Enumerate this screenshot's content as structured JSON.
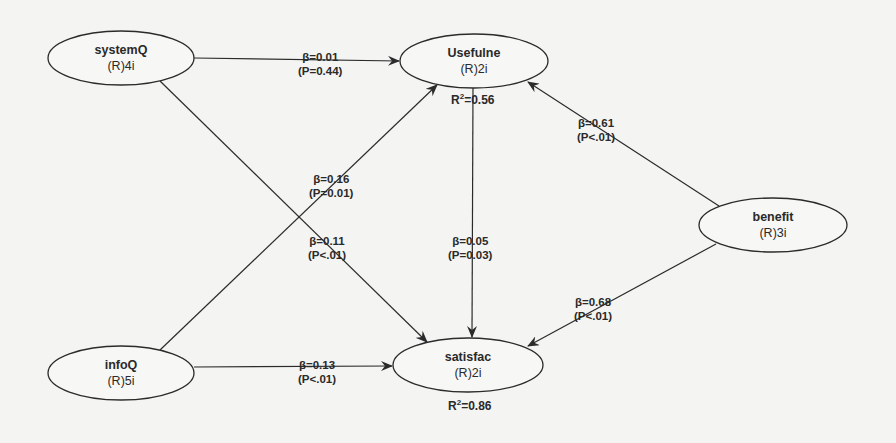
{
  "diagram": {
    "type": "structural-equation-path-model",
    "nodes": [
      {
        "id": "systemQ",
        "name": "systemQ",
        "sub": "(R)4i",
        "cx": 121,
        "cy": 58,
        "rx": 73,
        "ry": 27
      },
      {
        "id": "usefulne",
        "name": "Usefulne",
        "sub": "(R)2i",
        "cx": 474,
        "cy": 61,
        "rx": 74,
        "ry": 27
      },
      {
        "id": "benefit",
        "name": "benefit",
        "sub": "(R)3i",
        "cx": 773,
        "cy": 225,
        "rx": 74,
        "ry": 27
      },
      {
        "id": "infoQ",
        "name": "infoQ",
        "sub": "(R)5i",
        "cx": 121,
        "cy": 373,
        "rx": 73,
        "ry": 27
      },
      {
        "id": "satisfac",
        "name": "satisfac",
        "sub": "(R)2i",
        "cx": 468,
        "cy": 365,
        "rx": 75,
        "ry": 27
      }
    ],
    "r_squared": {
      "usefulne": {
        "label": "R",
        "sup": "2",
        "value": "=0.56"
      },
      "satisfac": {
        "label": "R",
        "sup": "2",
        "value": "=0.86"
      }
    },
    "edges": [
      {
        "id": "systemQ-usefulne",
        "from": "systemQ",
        "to": "usefulne",
        "beta": "β=0.01",
        "p": "(P=0.44)"
      },
      {
        "id": "systemQ-satisfac",
        "from": "systemQ",
        "to": "satisfac",
        "beta": "β=0.11",
        "p": "(P<.01)"
      },
      {
        "id": "infoQ-usefulne",
        "from": "infoQ",
        "to": "usefulne",
        "beta": "β=0.16",
        "p": "(P=0.01)"
      },
      {
        "id": "infoQ-satisfac",
        "from": "infoQ",
        "to": "satisfac",
        "beta": "β=0.13",
        "p": "(P<.01)"
      },
      {
        "id": "usefulne-satisfac",
        "from": "usefulne",
        "to": "satisfac",
        "beta": "β=0.05",
        "p": "(P=0.03)"
      },
      {
        "id": "benefit-usefulne",
        "from": "benefit",
        "to": "usefulne",
        "beta": "β=0.61",
        "p": "(P<.01)"
      },
      {
        "id": "benefit-satisfac",
        "from": "benefit",
        "to": "satisfac",
        "beta": "β=0.68",
        "p": "(P<.01)"
      }
    ]
  }
}
